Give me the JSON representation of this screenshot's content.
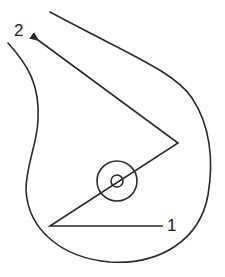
{
  "diagram": {
    "type": "breast self-examination path diagram",
    "stroke_color": "#2a2a2a",
    "background": "#ffffff",
    "labels": {
      "start": "1",
      "end": "2"
    },
    "elements": [
      {
        "name": "breast-outline",
        "description": "outer contour of breast (side view, left side open at top)"
      },
      {
        "name": "areola-circle",
        "description": "outer circle around nipple"
      },
      {
        "name": "nipple-circle",
        "description": "inner small circle"
      },
      {
        "name": "path-line",
        "description": "zig-zag path starting at label 1, passing through nipple, ending with arrow toward label 2"
      }
    ]
  }
}
